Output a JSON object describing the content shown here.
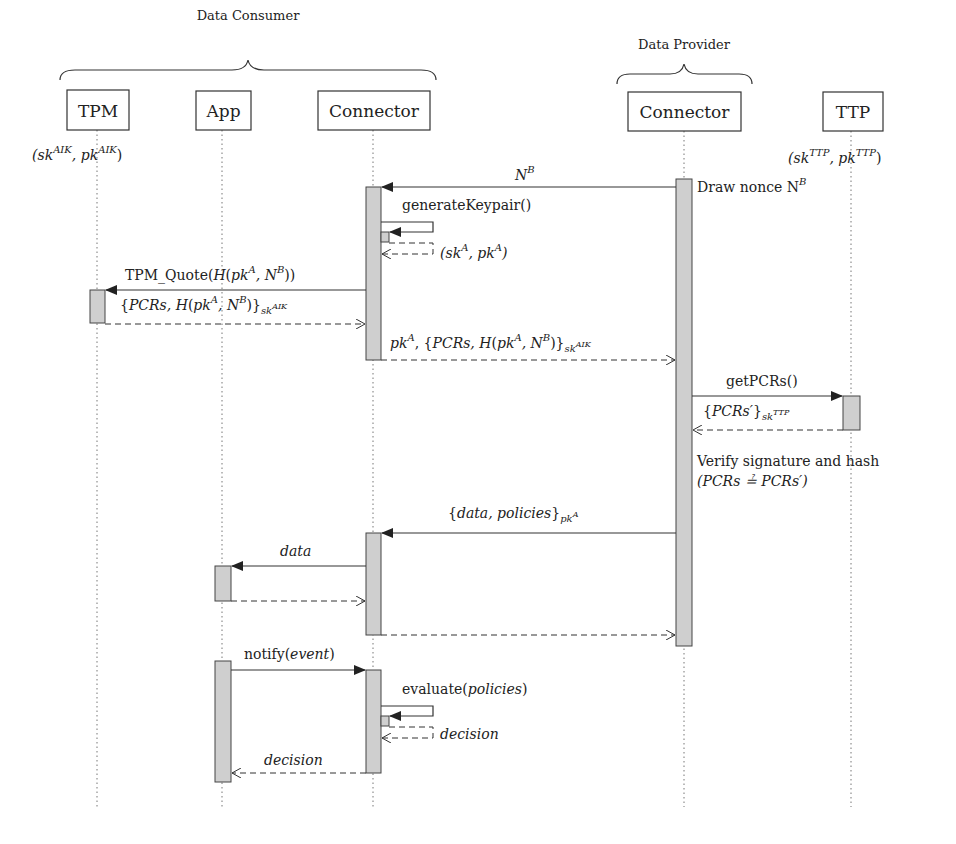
{
  "groups": [
    {
      "label": "Data Consumer",
      "x1": 60,
      "x2": 436,
      "y": 72,
      "labelX": 248,
      "labelY": 20
    },
    {
      "label": "Data Provider",
      "x1": 617,
      "x2": 752,
      "y": 81,
      "labelX": 684,
      "labelY": 49
    }
  ],
  "actors": [
    {
      "id": "tpm",
      "label": "TPM",
      "x": 97,
      "boxX": 67,
      "boxW": 62,
      "keys": "(sk^AIK, pk^AIK)"
    },
    {
      "id": "app",
      "label": "App",
      "x": 222,
      "boxX": 196,
      "boxW": 55,
      "keys": ""
    },
    {
      "id": "consumer-connector",
      "label": "Connector",
      "x": 373,
      "boxX": 318,
      "boxW": 112,
      "keys": ""
    },
    {
      "id": "provider-connector",
      "label": "Connector",
      "x": 684,
      "boxX": 628,
      "boxW": 113,
      "keys": ""
    },
    {
      "id": "ttp",
      "label": "TTP",
      "x": 851,
      "boxX": 823,
      "boxW": 60,
      "keys": "(sk^TTP, pk^TTP)"
    }
  ],
  "keys": {
    "tpm": {
      "open": "(sk",
      "sup1": "AIK",
      "mid": ", pk",
      "sup2": "AIK",
      "close": ")"
    },
    "ttp": {
      "open": "(sk",
      "sup1": "TTP",
      "mid": ", pk",
      "sup2": "TTP",
      "close": ")"
    }
  },
  "notes": {
    "draw_nonce": "Draw nonce N",
    "draw_nonce_sup": "B",
    "verify_line1": "Verify signature and hash",
    "verify_line2": "(PCRs ≟ PCRs′)"
  },
  "messages": [
    {
      "id": "m1",
      "from": "provider-connector",
      "to": "consumer-connector",
      "type": "sync",
      "label": "N^B"
    },
    {
      "id": "m2",
      "from": "consumer-connector",
      "to": "consumer-connector",
      "type": "self",
      "label": "generateKeypair()"
    },
    {
      "id": "m3",
      "from": "consumer-connector",
      "to": "consumer-connector",
      "type": "self-return",
      "label": "(sk^A, pk^A)"
    },
    {
      "id": "m4",
      "from": "consumer-connector",
      "to": "tpm",
      "type": "sync",
      "label": "TPM_Quote(H(pk^A, N^B))"
    },
    {
      "id": "m5",
      "from": "tpm",
      "to": "consumer-connector",
      "type": "return",
      "label": "{PCRs, H(pk^A, N^B)}_sk^AIK"
    },
    {
      "id": "m6",
      "from": "consumer-connector",
      "to": "provider-connector",
      "type": "return",
      "label": "pk^A, {PCRs, H(pk^A, N^B)}_sk^AIK"
    },
    {
      "id": "m7",
      "from": "provider-connector",
      "to": "ttp",
      "type": "sync",
      "label": "getPCRs()"
    },
    {
      "id": "m8",
      "from": "ttp",
      "to": "provider-connector",
      "type": "return",
      "label": "{PCRs′}_sk^TTP"
    },
    {
      "id": "m9",
      "from": "provider-connector",
      "to": "consumer-connector",
      "type": "sync",
      "label": "{data, policies}_pk^A"
    },
    {
      "id": "m10",
      "from": "consumer-connector",
      "to": "app",
      "type": "sync",
      "label": "data"
    },
    {
      "id": "m11",
      "from": "app",
      "to": "consumer-connector",
      "type": "return",
      "label": ""
    },
    {
      "id": "m12",
      "from": "consumer-connector",
      "to": "provider-connector",
      "type": "return",
      "label": ""
    },
    {
      "id": "m13",
      "from": "app",
      "to": "consumer-connector",
      "type": "sync",
      "label": "notify(event)"
    },
    {
      "id": "m14",
      "from": "consumer-connector",
      "to": "consumer-connector",
      "type": "self",
      "label": "evaluate(policies)"
    },
    {
      "id": "m15",
      "from": "consumer-connector",
      "to": "consumer-connector",
      "type": "self-return",
      "label": "decision"
    },
    {
      "id": "m16",
      "from": "consumer-connector",
      "to": "app",
      "type": "return",
      "label": "decision"
    }
  ],
  "text": {
    "m1": {
      "base": "N",
      "sup": "B"
    },
    "m2": "generateKeypair()",
    "m3": {
      "p1": "(sk",
      "s1": "A",
      "p2": ", pk",
      "s2": "A",
      "p3": ")"
    },
    "m4": {
      "p1": "TPM_Quote(",
      "p2": "H",
      "p3": "(",
      "p4": "pk",
      "s1": "A",
      "p5": ", N",
      "s2": "B",
      "p6": "))"
    },
    "m5": {
      "p1": "{",
      "p2": "PCRs, H",
      "p3": "(",
      "p4": "pk",
      "s1": "A",
      "p5": ", N",
      "s2": "B",
      "p6": ")}",
      "sub": "sk",
      "subsup": "AIK"
    },
    "m6": {
      "p0": "pk",
      "s0": "A",
      "p1": ", {",
      "p2": "PCRs, H",
      "p3": "(",
      "p4": "pk",
      "s1": "A",
      "p5": ", N",
      "s2": "B",
      "p6": ")}",
      "sub": "sk",
      "subsup": "AIK"
    },
    "m7": "getPCRs()",
    "m8": {
      "p1": "{",
      "p2": "PCRs′",
      "p3": "}",
      "sub": "sk",
      "subsup": "TTP"
    },
    "m9": {
      "p1": "{",
      "p2": "data, policies",
      "p3": "}",
      "sub": "pk",
      "subsup": "A"
    },
    "m10": "data",
    "m13": {
      "p1": "notify(",
      "p2": "event",
      "p3": ")"
    },
    "m14": {
      "p1": "evaluate(",
      "p2": "policies",
      "p3": ")"
    },
    "m15": "decision",
    "m16": "decision"
  },
  "colors": {
    "line": "#3a3a3a",
    "activation_fill": "#cfcfcf",
    "lifeline": "#777777",
    "background": "#ffffff"
  }
}
